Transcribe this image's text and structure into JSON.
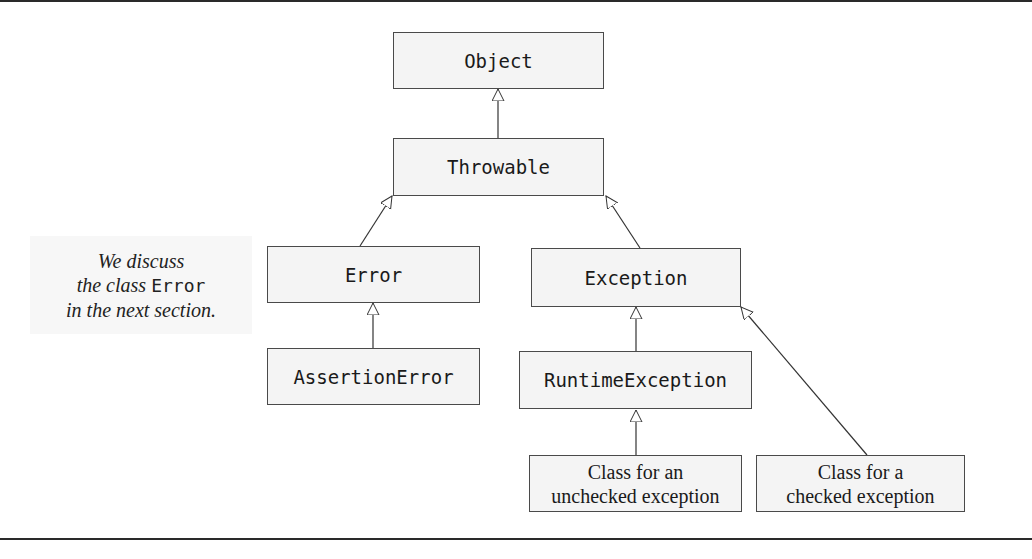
{
  "diagram": {
    "nodes": {
      "object": {
        "label": "Object"
      },
      "throwable": {
        "label": "Throwable"
      },
      "error": {
        "label": "Error"
      },
      "exception": {
        "label": "Exception"
      },
      "assertion_error": {
        "label": "AssertionError"
      },
      "runtime_exception": {
        "label": "RuntimeException"
      },
      "unchecked": {
        "line1": "Class for an",
        "line2": "unchecked exception"
      },
      "checked": {
        "line1": "Class for a",
        "line2": "checked exception"
      }
    },
    "edges": [
      {
        "from": "Throwable",
        "to": "Object",
        "type": "inheritance"
      },
      {
        "from": "Error",
        "to": "Throwable",
        "type": "inheritance"
      },
      {
        "from": "Exception",
        "to": "Throwable",
        "type": "inheritance"
      },
      {
        "from": "AssertionError",
        "to": "Error",
        "type": "inheritance"
      },
      {
        "from": "RuntimeException",
        "to": "Exception",
        "type": "inheritance"
      },
      {
        "from": "Class for an unchecked exception",
        "to": "RuntimeException",
        "type": "inheritance"
      },
      {
        "from": "Class for a checked exception",
        "to": "Exception",
        "type": "inheritance"
      }
    ],
    "note": {
      "line1": "We discuss",
      "line2_pre": "the class ",
      "line2_code": "Error",
      "line3": "in the next section."
    }
  }
}
